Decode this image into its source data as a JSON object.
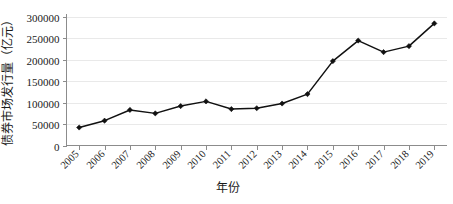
{
  "chart_data": {
    "type": "line",
    "title": "",
    "xlabel": "年份",
    "ylabel": "债券市场发行量（亿元）",
    "categories": [
      "2005",
      "2006",
      "2007",
      "2008",
      "2009",
      "2010",
      "2011",
      "2012",
      "2013",
      "2014",
      "2015",
      "2016",
      "2017",
      "2018",
      "2019"
    ],
    "values": [
      42000,
      58000,
      83000,
      75000,
      92000,
      103000,
      85000,
      87000,
      98000,
      120000,
      197000,
      245000,
      218000,
      232000,
      285000
    ],
    "series": [
      {
        "name": "债券市场发行量",
        "values": [
          42000,
          58000,
          83000,
          75000,
          92000,
          103000,
          85000,
          87000,
          98000,
          120000,
          197000,
          245000,
          218000,
          232000,
          285000
        ]
      }
    ],
    "ylim": [
      0,
      300000
    ],
    "yticks": [
      0,
      50000,
      100000,
      150000,
      200000,
      250000,
      300000
    ],
    "ytick_labels": [
      "0",
      "50000",
      "100000",
      "150000",
      "200000",
      "250000",
      "300000"
    ],
    "xtick_labels": [
      "2005",
      "2006",
      "2007",
      "2008",
      "2009",
      "2010",
      "2011",
      "2012",
      "2013",
      "2014",
      "2015",
      "2016",
      "2017",
      "2018",
      "2019"
    ],
    "grid": true,
    "legend": false,
    "legend_position": "none",
    "marker": "diamond",
    "line_color": "#111111",
    "grid_color": "#e9e9e9",
    "axis_color": "#8c8c8c",
    "background_color": "#ffffff",
    "xtick_label_rotation": 45,
    "annotations": []
  },
  "axis": {
    "x_title": "年份",
    "y_title": "债券市场发行量（亿元）"
  }
}
